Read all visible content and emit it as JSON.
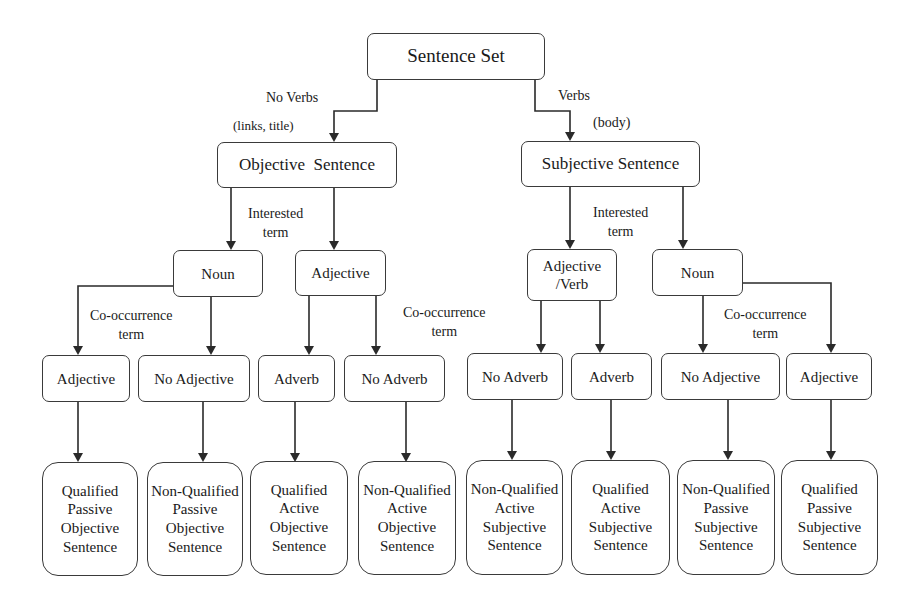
{
  "diagram": {
    "root": {
      "label": "Sentence Set"
    },
    "level1": [
      {
        "label": "Objective  Sentence",
        "edge_label": "No Verbs",
        "edge_sublabel": "(links, title)"
      },
      {
        "label": "Subjective Sentence",
        "edge_label": "Verbs",
        "edge_sublabel": "(body)"
      }
    ],
    "level2": [
      {
        "label": "Noun"
      },
      {
        "label": "Adjective"
      },
      {
        "label": "Adjective\n/Verb"
      },
      {
        "label": "Noun"
      }
    ],
    "level2_edge_labels": [
      "Interested\nterm",
      "Interested\nterm"
    ],
    "level3": [
      {
        "label": "Adjective"
      },
      {
        "label": "No Adjective"
      },
      {
        "label": "Adverb"
      },
      {
        "label": "No Adverb"
      },
      {
        "label": "No Adverb"
      },
      {
        "label": "Adverb"
      },
      {
        "label": "No Adjective"
      },
      {
        "label": "Adjective"
      }
    ],
    "level3_edge_labels": [
      "Co-occurrence\nterm",
      "Co-occurrence\nterm",
      "Co-occurrence\nterm"
    ],
    "level4": [
      {
        "label": "Qualified\nPassive\nObjective\nSentence"
      },
      {
        "label": "Non-Qualified\nPassive\nObjective\nSentence"
      },
      {
        "label": "Qualified\nActive\nObjective\nSentence"
      },
      {
        "label": "Non-Qualified\nActive\nObjective\nSentence"
      },
      {
        "label": "Non-Qualified\nActive\nSubjective\nSentence"
      },
      {
        "label": "Qualified\nActive\nSubjective\nSentence"
      },
      {
        "label": "Non-Qualified\nPassive\nSubjective\nSentence"
      },
      {
        "label": "Qualified\nPassive\nSubjective\nSentence"
      }
    ],
    "colors": {
      "line": "#2a2a2a",
      "text": "#1a1a1a",
      "background": "#ffffff"
    }
  }
}
